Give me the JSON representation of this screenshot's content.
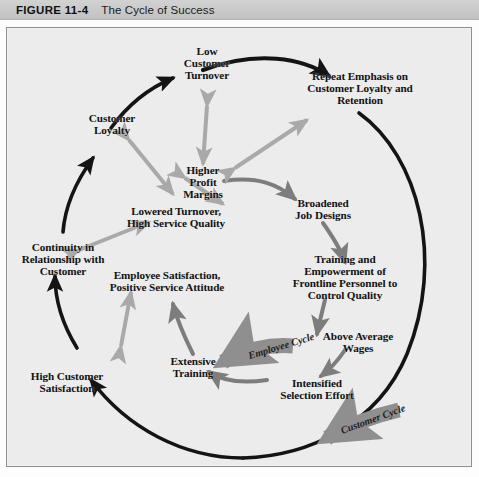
{
  "header": {
    "figure_number": "FIGURE 11-4",
    "figure_title": "The Cycle of Success"
  },
  "diagram": {
    "title": "The Cycle of Success",
    "nodes": [
      {
        "id": "low-customer-turnover",
        "label": "Low\nCustomer\nTurnover"
      },
      {
        "id": "repeat-emphasis",
        "label": "Repeat Emphasis on\nCustomer Loyalty and\nRetention"
      },
      {
        "id": "customer-loyalty",
        "label": "Customer\nLoyalty"
      },
      {
        "id": "higher-profit-margins",
        "label": "Higher\nProfit\nMargins"
      },
      {
        "id": "lowered-turnover",
        "label": "Lowered Turnover,\nHigh Service Quality"
      },
      {
        "id": "broadened-job-designs",
        "label": "Broadened\nJob Designs"
      },
      {
        "id": "continuity-relationship",
        "label": "Continuity in\nRelationship with\nCustomer"
      },
      {
        "id": "employee-satisfaction",
        "label": "Employee Satisfaction,\nPositive Service Attitude"
      },
      {
        "id": "training-empowerment",
        "label": "Training and Empowerment of\nFrontline Personnel to Control Quality"
      },
      {
        "id": "extensive-training",
        "label": "Extensive\nTraining"
      },
      {
        "id": "above-average-wages",
        "label": "Above Average\nWages"
      },
      {
        "id": "high-customer-satisfaction",
        "label": "High Customer\nSatisfaction"
      },
      {
        "id": "intensified-selection",
        "label": "Intensified\nSelection Effort"
      }
    ],
    "cycle_banners": [
      {
        "id": "employee-cycle",
        "label": "Employee Cycle"
      },
      {
        "id": "customer-cycle",
        "label": "Customer Cycle"
      }
    ],
    "colors": {
      "background": "#ececec",
      "outer_cycle_arrow": "#141414",
      "inner_cycle_arrow": "#7d7d7d",
      "link_arrow": "#a9a9a9",
      "banner_fill": "#8f8f8f",
      "header_bar": "#c8c8c8",
      "frame_border": "#8e8e8e",
      "text": "#121212"
    }
  }
}
